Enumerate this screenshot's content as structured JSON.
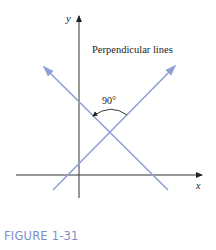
{
  "figure": {
    "title": "Perpendicular lines",
    "angle_label": "90°",
    "x_axis_label": "x",
    "y_axis_label": "y",
    "caption": "FIGURE 1-31",
    "colors": {
      "axis": "#333333",
      "line": "#8fa1d4",
      "caption": "#7c8fc4",
      "text": "#222222"
    }
  }
}
